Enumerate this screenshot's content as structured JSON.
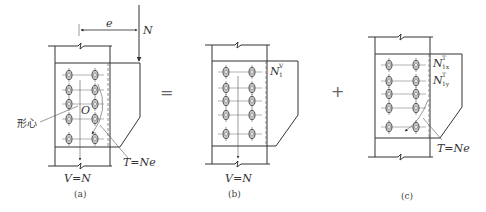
{
  "figure": {
    "operators": {
      "equals": "=",
      "plus": "+"
    },
    "panel_a": {
      "caption": "(a)",
      "load_label": "N",
      "eccentricity_label": "e",
      "centroid_label_cn": "形心",
      "centroid_point_label": "O",
      "torque_label": "T=Ne",
      "shear_label": "V=N"
    },
    "panel_b": {
      "caption": "(b)",
      "bolt_force_label_main": "N",
      "bolt_force_label_sup": "V",
      "bolt_force_label_sub": "1",
      "shear_label": "V=N"
    },
    "panel_c": {
      "caption": "(c)",
      "bolt_force_x_main": "N",
      "bolt_force_x_sup": "T",
      "bolt_force_x_sub": "1x",
      "bolt_force_y_main": "N",
      "bolt_force_y_sup": "T",
      "bolt_force_y_sub": "1y",
      "torque_label": "T=Ne"
    },
    "bolt_layout": {
      "columns": 2,
      "rows": 5
    },
    "colors": {
      "line": "#333333",
      "bolt_fill": "#c8c8c8",
      "background": "#ffffff"
    }
  }
}
